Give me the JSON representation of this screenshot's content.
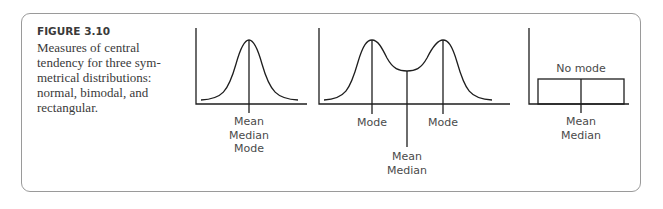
{
  "figure": {
    "label": "FIGURE 3.10",
    "caption_lines": [
      "Measures of central",
      "tendency for three sym-",
      "metrical distributions:",
      "normal, bimodal, and",
      "rectangular."
    ]
  },
  "panels": {
    "normal": {
      "name": "normal",
      "center_labels": [
        "Mean",
        "Median",
        "Mode"
      ]
    },
    "bimodal": {
      "name": "bimodal",
      "left_peak_label": "Mode",
      "right_peak_label": "Mode",
      "center_labels": [
        "Mean",
        "Median"
      ]
    },
    "rectangular": {
      "name": "rectangular",
      "top_label": "No mode",
      "center_labels": [
        "Mean",
        "Median"
      ]
    }
  },
  "colors": {
    "line": "#1e1e1e",
    "frame": "#9a9a9a",
    "text": "#3a3a3a"
  }
}
